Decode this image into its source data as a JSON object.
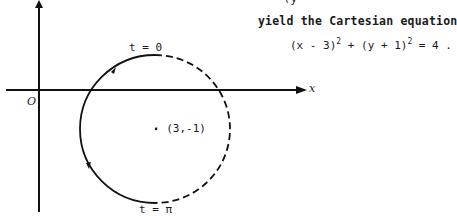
{
  "text": {
    "cut_top": "(y",
    "yield_line": "yield the Cartesian equation",
    "equation": {
      "part1": "(x - 3)",
      "exp1": "2",
      "part2": " + (y + 1)",
      "exp2": "2",
      "part3": " = 4  ."
    }
  },
  "figure": {
    "origin_label": "O",
    "x_axis_label": "x",
    "top_label": "t = 0",
    "bottom_label": "t = π",
    "center_label": "· (3,-1)",
    "solid_arc": "left half (t from 0 to π, counterclockwise)",
    "dashed_arc": "right half"
  }
}
